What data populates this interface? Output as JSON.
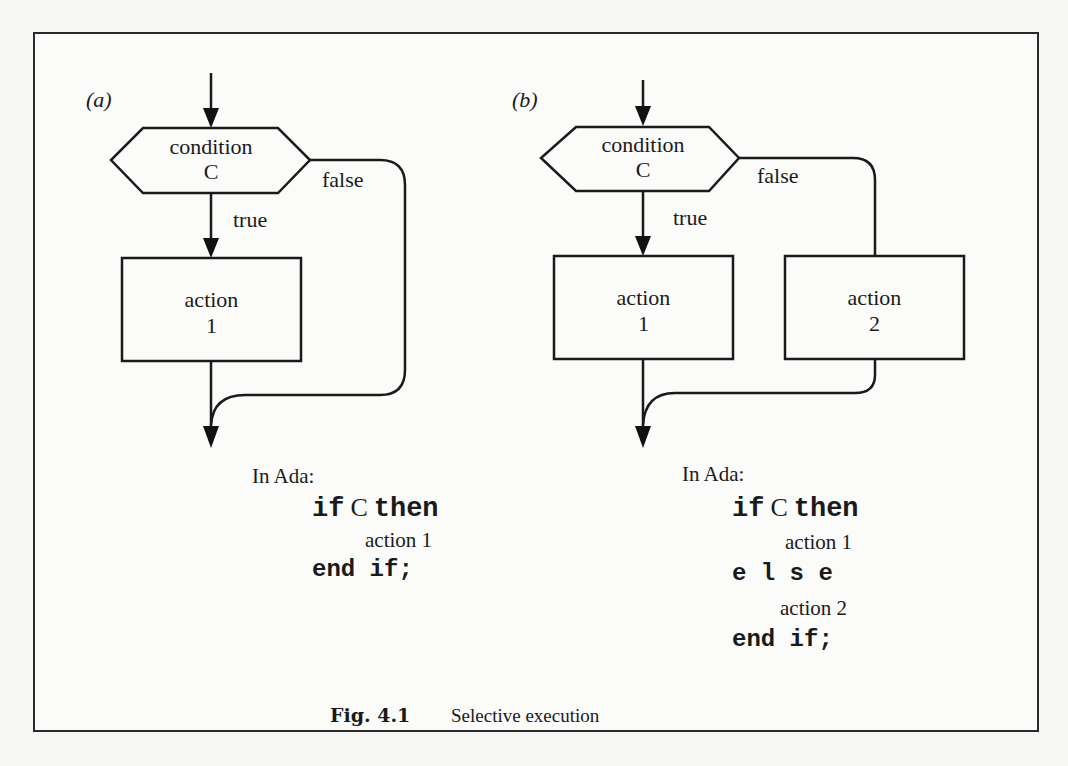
{
  "figure": {
    "number_label": "Fig.  4.1",
    "caption": "Selective execution"
  },
  "panel_a": {
    "tag": "(a)",
    "condition_line1": "condition",
    "condition_line2": "C",
    "true_label": "true",
    "false_label": "false",
    "action1_line1": "action",
    "action1_line2": "1",
    "code_intro": "In Ada:",
    "code": {
      "kw_if": "if",
      "cond": "C",
      "kw_then": "then",
      "action1": "action 1",
      "kw_end_if": "end if;"
    }
  },
  "panel_b": {
    "tag": "(b)",
    "condition_line1": "condition",
    "condition_line2": "C",
    "true_label": "true",
    "false_label": "false",
    "action1_line1": "action",
    "action1_line2": "1",
    "action2_line1": "action",
    "action2_line2": "2",
    "code_intro": "In Ada:",
    "code": {
      "kw_if": "if",
      "cond": "C",
      "kw_then": "then",
      "action1": "action 1",
      "kw_else": "e l s e",
      "action2": "action 2",
      "kw_end_if": "end if;"
    }
  }
}
